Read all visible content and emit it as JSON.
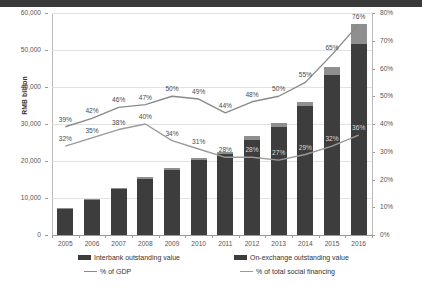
{
  "chart_data": {
    "type": "bar",
    "title": "",
    "subtitle": "",
    "xlabel": "",
    "ylabel": "RMB billion",
    "ylabel_right": "",
    "categories": [
      "2005",
      "2006",
      "2007",
      "2008",
      "2009",
      "2010",
      "2011",
      "2012",
      "2013",
      "2014",
      "2015",
      "2016"
    ],
    "ylim": [
      0,
      60000
    ],
    "yticks": [
      0,
      10000,
      20000,
      30000,
      40000,
      50000,
      60000
    ],
    "ytick_labels": [
      "0",
      "10,000",
      "20,000",
      "30,000",
      "40,000",
      "50,000",
      "60,000"
    ],
    "ylim_right": [
      0,
      80
    ],
    "yticks_right": [
      0,
      10,
      20,
      30,
      40,
      50,
      60,
      70,
      80
    ],
    "ytick_labels_right": [
      "0%",
      "10%",
      "20%",
      "30%",
      "40%",
      "50%",
      "60%",
      "70%",
      "80%"
    ],
    "grid": true,
    "legend_position": "bottom",
    "series": [
      {
        "name": "Interbank outstanding value",
        "type": "bar",
        "stack": "total",
        "color": "#3d3d3d",
        "axis": "left",
        "values": [
          7200,
          9400,
          12400,
          15200,
          17600,
          20300,
          21800,
          25800,
          29300,
          34900,
          43300,
          51500
        ]
      },
      {
        "name": "On-exchange outstanding value",
        "type": "bar",
        "stack": "total",
        "color": "#8f8f8f",
        "axis": "left",
        "values": [
          200,
          250,
          300,
          350,
          380,
          420,
          700,
          900,
          900,
          1100,
          2100,
          5600
        ]
      },
      {
        "name": "% of GDP",
        "type": "line",
        "color": "#8a8a8a",
        "axis": "right",
        "values": [
          39,
          42,
          46,
          47,
          50,
          49,
          44,
          48,
          50,
          55,
          65,
          76
        ],
        "labels": [
          "39%",
          "42%",
          "46%",
          "47%",
          "50%",
          "49%",
          "44%",
          "48%",
          "50%",
          "55%",
          "65%",
          "76%"
        ]
      },
      {
        "name": "% of total social financing",
        "type": "line",
        "color": "#9b9b9b",
        "axis": "right",
        "values": [
          32,
          35,
          38,
          40,
          34,
          31,
          28,
          28,
          27,
          29,
          32,
          36
        ],
        "labels": [
          "32%",
          "35%",
          "38%",
          "40%",
          "34%",
          "31%",
          "28%",
          "28%",
          "27%",
          "29%",
          "32%",
          "36%"
        ]
      }
    ],
    "annotations": []
  },
  "legend": {
    "items": [
      {
        "label": "Interbank outstanding value",
        "marker": "bar-swatch-dark"
      },
      {
        "label": "On-exchange outstanding value",
        "marker": "bar-swatch-light"
      },
      {
        "label": "% of GDP",
        "marker": "line-swatch"
      },
      {
        "label": "% of total social financing",
        "marker": "line-swatch"
      }
    ]
  },
  "colors": {
    "interbank": "#3d3d3d",
    "on_exchange": "#8f8f8f",
    "gdp_line": "#8a8a8a",
    "tsf_line": "#9b9b9b",
    "grid": "#e2e2e2",
    "axis": "#9a9a9a",
    "text": "#555555"
  }
}
